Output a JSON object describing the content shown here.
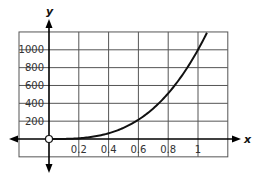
{
  "chart_data": {
    "type": "line",
    "title": "",
    "xlabel": "x",
    "ylabel": "y",
    "xlim": [
      0,
      1.2
    ],
    "ylim": [
      -200,
      1200
    ],
    "x_ticks": [
      0.2,
      0.4,
      0.6,
      0.8,
      1
    ],
    "x_tick_labels": [
      "0.2",
      "0.4",
      "0.6",
      "0.8",
      "1"
    ],
    "y_ticks": [
      200,
      400,
      600,
      800,
      1000
    ],
    "y_tick_labels": [
      "200",
      "400",
      "600",
      "800",
      "1000"
    ],
    "grid": true,
    "legend": null,
    "annotations": [
      "open circle at origin (0, 0)"
    ],
    "series": [
      {
        "name": "curve",
        "function": "y = 1000x^3",
        "x": [
          0,
          0.1,
          0.2,
          0.3,
          0.4,
          0.5,
          0.6,
          0.7,
          0.8,
          0.9,
          1.0,
          1.06
        ],
        "values": [
          0,
          1,
          8,
          27,
          64,
          125,
          216,
          343,
          512,
          729,
          1000,
          1191
        ]
      }
    ],
    "colors": {
      "curve": "#111111",
      "grid": "#444444",
      "axes": "#000000"
    }
  }
}
